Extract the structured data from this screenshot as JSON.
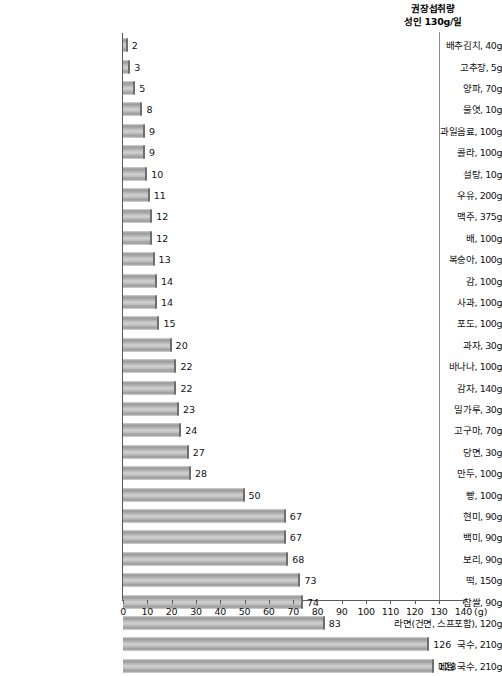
{
  "chart_data": {
    "type": "bar",
    "orientation": "horizontal",
    "title": "",
    "xlabel": "(g)",
    "ylabel": "",
    "xlim": [
      0,
      140
    ],
    "xticks": [
      0,
      10,
      20,
      30,
      40,
      50,
      60,
      70,
      80,
      90,
      100,
      110,
      120,
      130,
      140
    ],
    "grid": false,
    "legend": null,
    "categories": [
      "배추김치, 40g",
      "고추장, 5g",
      "양파, 70g",
      "물엿, 10g",
      "과일음료, 100g",
      "콜라, 100g",
      "설탕, 10g",
      "우유, 200g",
      "맥주, 375g",
      "배, 100g",
      "복숭아, 100g",
      "감, 100g",
      "사과, 100g",
      "포도, 100g",
      "과자, 30g",
      "바나나, 100g",
      "감자, 140g",
      "밀가루, 30g",
      "고구마, 70g",
      "당면, 30g",
      "만두, 100g",
      "빵, 100g",
      "현미, 90g",
      "백미, 90g",
      "보리, 90g",
      "떡, 150g",
      "찹쌀, 90g",
      "라면(건면, 스프포함), 120g",
      "국수, 210g",
      "메밀 국수, 210g"
    ],
    "values": [
      2,
      3,
      5,
      8,
      9,
      9,
      10,
      11,
      12,
      12,
      13,
      14,
      14,
      15,
      20,
      22,
      22,
      23,
      24,
      27,
      28,
      50,
      67,
      67,
      68,
      73,
      74,
      83,
      126,
      128
    ],
    "annotations": [
      {
        "name": "recommended-intake",
        "line1": "권장섭취량",
        "line2": "성인 130g/일",
        "value": 130
      }
    ],
    "colors": {
      "bar_light": "#d2d2d2",
      "bar_dark": "#8c8c8c",
      "bar_edge": "#6e6e6e",
      "axis": "#5a5a5a",
      "reference_line": "#8a8a8a",
      "text": "#111111"
    }
  }
}
